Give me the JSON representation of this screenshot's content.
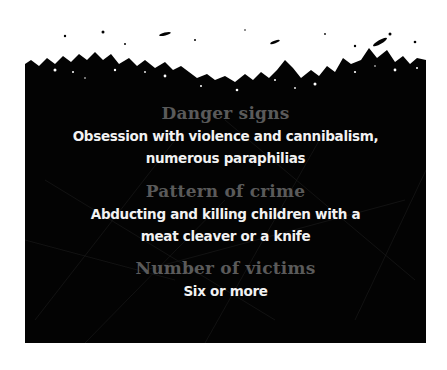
{
  "colors": {
    "background": "#ffffff",
    "panel": "#030303",
    "heading": "#5a5a5a",
    "body_text": "#f2f2f2"
  },
  "sections": [
    {
      "heading": "Danger signs",
      "lines": [
        "Obsession with violence and cannibalism,",
        "numerous paraphilias"
      ]
    },
    {
      "heading": "Pattern of crime",
      "lines": [
        "Abducting and killing children with a",
        "meat cleaver or a knife"
      ]
    },
    {
      "heading": "Number of victims",
      "lines": [
        "Six or more"
      ]
    }
  ]
}
